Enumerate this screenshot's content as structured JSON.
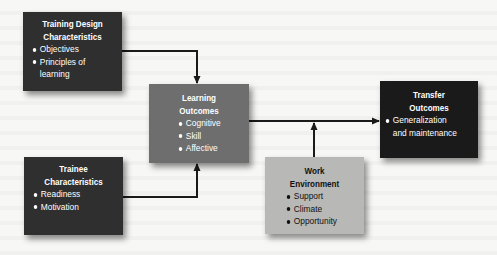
{
  "diagram": {
    "nodes": [
      {
        "id": "training-design",
        "title_lines": [
          "Training Design",
          "Characteristics"
        ],
        "items": [
          "Objectives",
          "Principles of",
          "learning"
        ],
        "fill": "#2f2f2f"
      },
      {
        "id": "trainee",
        "title_lines": [
          "Trainee",
          "Characteristics"
        ],
        "items": [
          "Readiness",
          "Motivation"
        ],
        "fill": "#2f2f2f"
      },
      {
        "id": "learning-outcomes",
        "title_lines": [
          "Learning",
          "Outcomes"
        ],
        "items": [
          "Cognitive",
          "Skill",
          "Affective"
        ],
        "fill": "#6e6e6e"
      },
      {
        "id": "transfer-outcomes",
        "title_lines": [
          "Transfer",
          "Outcomes"
        ],
        "items": [
          "Generalization",
          "and maintenance"
        ],
        "fill": "#1a1a1a"
      },
      {
        "id": "work-environment",
        "title_lines": [
          "Work",
          "Environment"
        ],
        "items": [
          "Support",
          "Climate",
          "Opportunity"
        ],
        "fill": "#b8b8b6"
      }
    ],
    "edges": [
      {
        "from": "training-design",
        "to": "learning-outcomes"
      },
      {
        "from": "trainee",
        "to": "learning-outcomes"
      },
      {
        "from": "learning-outcomes",
        "to": "transfer-outcomes"
      },
      {
        "from": "work-environment",
        "to": "learning-outcomes->transfer-outcomes"
      }
    ]
  }
}
